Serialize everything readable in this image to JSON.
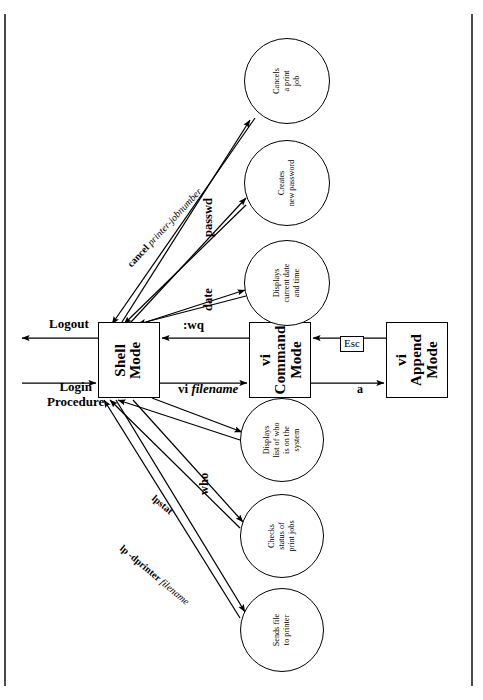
{
  "diagram": {
    "type": "state-transition",
    "line_color": "#000000",
    "background_color": "#ffffff"
  },
  "boxes": [
    {
      "id": "shell",
      "lines": [
        "Shell",
        "Mode"
      ]
    },
    {
      "id": "vicmd",
      "lines": [
        "vi",
        "Command",
        "Mode"
      ]
    },
    {
      "id": "viapp",
      "lines": [
        "vi",
        "Append",
        "Mode"
      ]
    }
  ],
  "circles": [
    {
      "id": "cancel",
      "lines": [
        "Cancels",
        "a print",
        "job"
      ]
    },
    {
      "id": "passwd",
      "lines": [
        "Creates",
        "new password"
      ]
    },
    {
      "id": "date",
      "lines": [
        "Displays",
        "current date",
        "and time"
      ]
    },
    {
      "id": "who",
      "lines": [
        "Displays",
        "list of who",
        "is on the",
        "system"
      ]
    },
    {
      "id": "lpstat",
      "lines": [
        "Checks",
        "status of",
        "print jobs"
      ]
    },
    {
      "id": "lp",
      "lines": [
        "Sends file",
        "to printer"
      ]
    }
  ],
  "edge_labels": {
    "logout": "Logout",
    "login": [
      "Login",
      "Procedure"
    ],
    "wq": ":wq",
    "vi_filename_cmd": "vi ",
    "vi_filename_arg": "filename",
    "esc": "Esc",
    "a": "a",
    "passwd": "passwd",
    "date": "date",
    "who": "who",
    "cancel_cmd": "cancel ",
    "cancel_arg": "printer-jobnumber",
    "lpstat": "lpstat",
    "lp_cmd": "lp -dprinter ",
    "lp_arg": "filename"
  }
}
